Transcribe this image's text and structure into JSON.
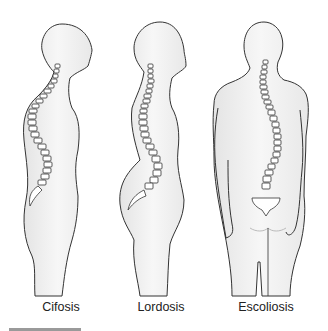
{
  "figure": {
    "panels": [
      {
        "id": "cifosis",
        "label": "Cifosis",
        "view": "side"
      },
      {
        "id": "lordosis",
        "label": "Lordosis",
        "view": "side"
      },
      {
        "id": "escoliosis",
        "label": "Escoliosis",
        "view": "back"
      }
    ],
    "colors": {
      "outline": "#333333",
      "body_fill": "#f2f2f2",
      "shade": "#dcdcdc",
      "vertebra_fill": "#ffffff"
    }
  }
}
